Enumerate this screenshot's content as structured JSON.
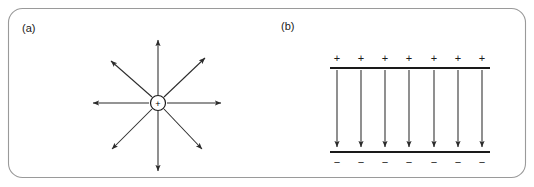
{
  "figure": {
    "width": 534,
    "height": 187,
    "background_color": "#ffffff",
    "border_color": "#9a9a9a",
    "ink_color": "#2b2b2b"
  },
  "panels": [
    {
      "id": "panel-a",
      "label": "(a)",
      "label_x": 22,
      "label_y": 32,
      "type": "point-charge-field",
      "charge": {
        "symbol": "+",
        "polarity": "positive",
        "center_x": 158,
        "center_y": 103,
        "radius": 7.5
      },
      "field_arrows": [
        {
          "name": "north",
          "angle_deg": 90,
          "tip_x": 158,
          "tip_y": 36,
          "start_x": 158,
          "start_y": 95
        },
        {
          "name": "northeast",
          "angle_deg": 45,
          "tip_x": 208,
          "tip_y": 55,
          "start_x": 164,
          "start_y": 97
        },
        {
          "name": "east",
          "angle_deg": 0,
          "tip_x": 225,
          "tip_y": 103,
          "start_x": 167,
          "start_y": 103
        },
        {
          "name": "southeast",
          "angle_deg": -45,
          "tip_x": 205,
          "tip_y": 152,
          "start_x": 164,
          "start_y": 109
        },
        {
          "name": "south",
          "angle_deg": -90,
          "tip_x": 158,
          "tip_y": 175,
          "start_x": 158,
          "start_y": 111
        },
        {
          "name": "southwest",
          "angle_deg": 225,
          "tip_x": 109,
          "tip_y": 152,
          "start_x": 152,
          "start_y": 109
        },
        {
          "name": "west",
          "angle_deg": 180,
          "tip_x": 89,
          "tip_y": 103,
          "start_x": 149,
          "start_y": 103
        },
        {
          "name": "northwest",
          "angle_deg": 135,
          "tip_x": 108,
          "tip_y": 58,
          "start_x": 152,
          "start_y": 97
        }
      ]
    },
    {
      "id": "panel-b",
      "label": "(b)",
      "label_x": 281,
      "label_y": 30,
      "type": "parallel-plate-field",
      "top_plate": {
        "x1": 330,
        "x2": 490,
        "y": 68,
        "charge_symbol": "+",
        "charge_count": 7,
        "charge_label_y": 61
      },
      "bottom_plate": {
        "x1": 330,
        "x2": 490,
        "y": 152,
        "charge_symbol": "−",
        "charge_count": 7,
        "charge_label_y": 165
      },
      "field_arrows": {
        "count": 7,
        "direction": "down",
        "start_y": 70,
        "tip_y": 151,
        "x_positions": [
          337,
          361,
          385,
          409,
          434,
          458,
          482
        ]
      }
    }
  ]
}
